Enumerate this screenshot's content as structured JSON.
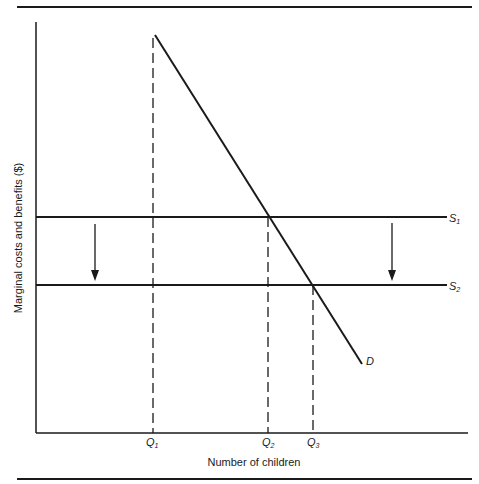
{
  "figure": {
    "y_axis_label": "Marginal costs and benefits ($)",
    "x_axis_label": "Number of children",
    "curves": {
      "demand": {
        "label": "D"
      },
      "supply_1": {
        "label": "S",
        "sub": "1"
      },
      "supply_2": {
        "label": "S",
        "sub": "2"
      }
    },
    "x_ticks": [
      {
        "label": "Q",
        "sub": "1"
      },
      {
        "label": "Q",
        "sub": "2"
      },
      {
        "label": "Q",
        "sub": "3"
      }
    ],
    "arrows": [
      "down-arrow-left",
      "down-arrow-right"
    ],
    "colors": {
      "ink": "#1a1a1a",
      "background": "#ffffff"
    }
  }
}
